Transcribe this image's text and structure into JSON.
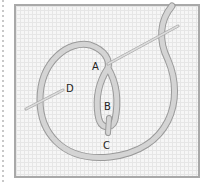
{
  "diagram": {
    "type": "embroidery-stitch-diagram",
    "labels": {
      "a": "A",
      "b": "B",
      "c": "C",
      "d": "D"
    },
    "colors": {
      "thread": "#c9c9c9",
      "thread_edge": "#9a9a9a",
      "needle": "#bdbdbd",
      "frame": "#a9a9a9",
      "grid": "#e6e6e6"
    }
  }
}
